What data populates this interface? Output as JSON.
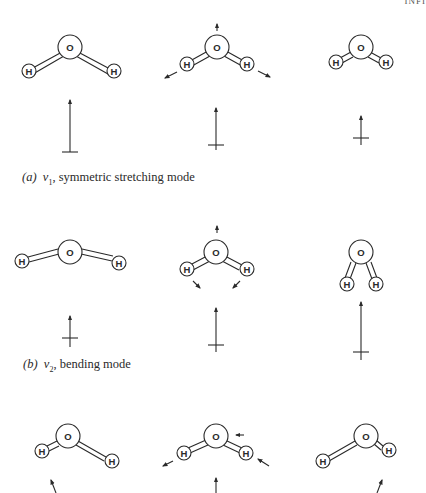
{
  "header_fragment": "INFI",
  "atom_labels": {
    "oxygen": "O",
    "hydrogen": "H"
  },
  "panels": [
    {
      "id": "a",
      "caption_label": "(a)",
      "caption_symbol": "ν",
      "caption_subscript": "1",
      "caption_text": ", symmetric stretching mode"
    },
    {
      "id": "b",
      "caption_label": "(b)",
      "caption_symbol": "ν",
      "caption_subscript": "2",
      "caption_text": ", bending mode"
    },
    {
      "id": "c",
      "caption_label": "",
      "caption_symbol": "",
      "caption_subscript": "",
      "caption_text": ""
    }
  ],
  "colors": {
    "ink": "#2a2a2a",
    "background": "#ffffff"
  }
}
